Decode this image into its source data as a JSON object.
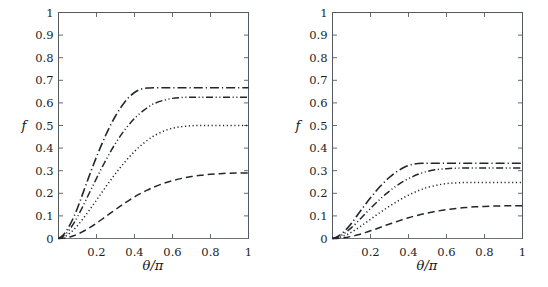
{
  "figure": {
    "background_color": "#ffffff",
    "line_color": "#23272b",
    "axis_color": "#555a5e",
    "panel_count": 2
  },
  "axis": {
    "x_title": "θ/π",
    "y_title": "f",
    "x_ticks": [
      "0.2",
      "0.4",
      "0.6",
      "0.8",
      "1"
    ],
    "x_tick_values": [
      0.2,
      0.4,
      0.6,
      0.8,
      1
    ],
    "y_ticks": [
      "0",
      "0.1",
      "0.2",
      "0.3",
      "0.4",
      "0.5",
      "0.6",
      "0.7",
      "0.8",
      "0.9",
      "1"
    ],
    "y_tick_values": [
      0,
      0.1,
      0.2,
      0.3,
      0.4,
      0.5,
      0.6,
      0.7,
      0.8,
      0.9,
      1
    ],
    "xlim": [
      0,
      1
    ],
    "ylim": [
      0,
      1
    ],
    "grid": false
  },
  "chart_data": [
    {
      "type": "line",
      "panel": "left",
      "title": "",
      "xlabel": "θ/π",
      "ylabel": "f",
      "xlim": [
        0,
        1
      ],
      "ylim": [
        0,
        1
      ],
      "grid": false,
      "legend": "none",
      "x": [
        0,
        0.02,
        0.04,
        0.06,
        0.08,
        0.1,
        0.125,
        0.15,
        0.175,
        0.2,
        0.225,
        0.25,
        0.275,
        0.3,
        0.325,
        0.35,
        0.375,
        0.4,
        0.425,
        0.45,
        0.475,
        0.5,
        0.55,
        0.6,
        0.65,
        0.7,
        0.75,
        0.8,
        0.85,
        0.9,
        0.95,
        1
      ],
      "series": [
        {
          "name": "curve-1",
          "linestyle": "dash-dot",
          "plateau_value": 0.667,
          "plateau_start_x": 0.5,
          "end_value": 0.667,
          "values": [
            0,
            0.012,
            0.032,
            0.06,
            0.095,
            0.135,
            0.192,
            0.25,
            0.307,
            0.361,
            0.412,
            0.46,
            0.503,
            0.542,
            0.576,
            0.605,
            0.629,
            0.646,
            0.658,
            0.664,
            0.666,
            0.667,
            0.667,
            0.667,
            0.667,
            0.667,
            0.667,
            0.667,
            0.667,
            0.667,
            0.667,
            0.667
          ]
        },
        {
          "name": "curve-2",
          "linestyle": "dash-dot-dot",
          "end_value": 0.625,
          "values": [
            0,
            0.008,
            0.022,
            0.042,
            0.067,
            0.096,
            0.137,
            0.18,
            0.223,
            0.266,
            0.308,
            0.348,
            0.386,
            0.421,
            0.453,
            0.482,
            0.508,
            0.531,
            0.551,
            0.568,
            0.583,
            0.596,
            0.611,
            0.62,
            0.624,
            0.625,
            0.625,
            0.625,
            0.625,
            0.625,
            0.625,
            0.625
          ]
        },
        {
          "name": "curve-3",
          "linestyle": "dotted",
          "end_value": 0.5,
          "values": [
            0,
            0.004,
            0.012,
            0.024,
            0.039,
            0.057,
            0.083,
            0.111,
            0.14,
            0.17,
            0.2,
            0.23,
            0.259,
            0.287,
            0.314,
            0.339,
            0.363,
            0.385,
            0.405,
            0.423,
            0.439,
            0.453,
            0.474,
            0.488,
            0.495,
            0.499,
            0.5,
            0.5,
            0.5,
            0.5,
            0.5,
            0.5
          ]
        },
        {
          "name": "curve-4",
          "linestyle": "dashed",
          "end_value": 0.29,
          "values": [
            0,
            0.001,
            0.003,
            0.007,
            0.012,
            0.019,
            0.029,
            0.041,
            0.054,
            0.068,
            0.083,
            0.098,
            0.113,
            0.128,
            0.143,
            0.157,
            0.171,
            0.184,
            0.196,
            0.207,
            0.217,
            0.227,
            0.243,
            0.256,
            0.266,
            0.274,
            0.28,
            0.284,
            0.287,
            0.289,
            0.29,
            0.29
          ]
        }
      ]
    },
    {
      "type": "line",
      "panel": "right",
      "title": "",
      "xlabel": "θ/π",
      "ylabel": "f",
      "xlim": [
        0,
        1
      ],
      "ylim": [
        0,
        1
      ],
      "grid": false,
      "legend": "none",
      "x": [
        0,
        0.02,
        0.04,
        0.06,
        0.08,
        0.1,
        0.125,
        0.15,
        0.175,
        0.2,
        0.225,
        0.25,
        0.275,
        0.3,
        0.325,
        0.35,
        0.375,
        0.4,
        0.425,
        0.45,
        0.475,
        0.5,
        0.55,
        0.6,
        0.65,
        0.7,
        0.75,
        0.8,
        0.85,
        0.9,
        0.95,
        1
      ],
      "series": [
        {
          "name": "curve-1",
          "linestyle": "dash-dot",
          "plateau_value": 0.333,
          "plateau_start_x": 0.48,
          "end_value": 0.333,
          "values": [
            0,
            0.006,
            0.016,
            0.03,
            0.047,
            0.067,
            0.096,
            0.125,
            0.153,
            0.18,
            0.206,
            0.23,
            0.251,
            0.271,
            0.288,
            0.302,
            0.314,
            0.323,
            0.329,
            0.332,
            0.333,
            0.333,
            0.333,
            0.333,
            0.333,
            0.333,
            0.333,
            0.333,
            0.333,
            0.333,
            0.333,
            0.333
          ]
        },
        {
          "name": "curve-2",
          "linestyle": "dash-dot-dot",
          "end_value": 0.312,
          "values": [
            0,
            0.004,
            0.011,
            0.021,
            0.034,
            0.048,
            0.068,
            0.09,
            0.112,
            0.133,
            0.154,
            0.174,
            0.193,
            0.21,
            0.226,
            0.241,
            0.254,
            0.265,
            0.275,
            0.284,
            0.291,
            0.297,
            0.305,
            0.309,
            0.311,
            0.312,
            0.312,
            0.312,
            0.312,
            0.312,
            0.312,
            0.312
          ]
        },
        {
          "name": "curve-3",
          "linestyle": "dotted",
          "end_value": 0.248,
          "values": [
            0,
            0.002,
            0.006,
            0.012,
            0.019,
            0.028,
            0.041,
            0.055,
            0.07,
            0.085,
            0.1,
            0.115,
            0.129,
            0.143,
            0.156,
            0.169,
            0.181,
            0.192,
            0.202,
            0.211,
            0.219,
            0.226,
            0.236,
            0.243,
            0.246,
            0.248,
            0.248,
            0.248,
            0.248,
            0.248,
            0.248,
            0.248
          ]
        },
        {
          "name": "curve-4",
          "linestyle": "dashed",
          "end_value": 0.145,
          "values": [
            0,
            0.0005,
            0.0015,
            0.0035,
            0.006,
            0.0095,
            0.0145,
            0.02,
            0.027,
            0.034,
            0.041,
            0.049,
            0.057,
            0.064,
            0.071,
            0.078,
            0.085,
            0.092,
            0.098,
            0.103,
            0.108,
            0.113,
            0.121,
            0.128,
            0.133,
            0.137,
            0.14,
            0.142,
            0.1435,
            0.1445,
            0.145,
            0.145
          ]
        }
      ]
    }
  ]
}
